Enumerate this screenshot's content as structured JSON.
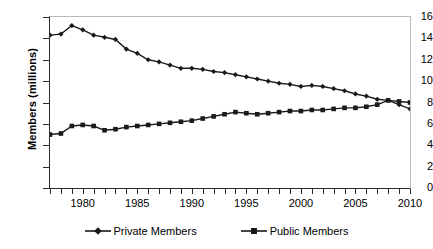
{
  "chart_data": {
    "type": "line",
    "title": "",
    "xlabel": "",
    "ylabel": "Members (millions)",
    "xlim": [
      1977,
      2010
    ],
    "ylim": [
      0,
      16
    ],
    "ytick_step": 2,
    "yticks": [
      "0",
      "2",
      "4",
      "6",
      "8",
      "10",
      "12",
      "14",
      "16"
    ],
    "xticks_labeled": [
      "1980",
      "1985",
      "1990",
      "1995",
      "2000",
      "2005",
      "2010"
    ],
    "xtick_minor_step": 1,
    "grid": false,
    "legend_position": "bottom-center",
    "x": [
      1977,
      1978,
      1979,
      1980,
      1981,
      1982,
      1983,
      1984,
      1985,
      1986,
      1987,
      1988,
      1989,
      1990,
      1991,
      1992,
      1993,
      1994,
      1995,
      1996,
      1997,
      1998,
      1999,
      2000,
      2001,
      2002,
      2003,
      2004,
      2005,
      2006,
      2007,
      2008,
      2009,
      2010
    ],
    "series": [
      {
        "name": "Private Members",
        "marker": "diamond",
        "color": "#1a1a1a",
        "values": [
          14.3,
          14.4,
          15.2,
          14.8,
          14.3,
          14.1,
          13.9,
          13.0,
          12.6,
          12.0,
          11.8,
          11.5,
          11.2,
          11.2,
          11.1,
          10.9,
          10.8,
          10.6,
          10.4,
          10.2,
          10.0,
          9.8,
          9.7,
          9.5,
          9.6,
          9.5,
          9.3,
          9.1,
          8.8,
          8.6,
          8.3,
          8.2,
          7.8,
          7.4
        ]
      },
      {
        "name": "Public Members",
        "marker": "square",
        "color": "#1a1a1a",
        "values": [
          5.0,
          5.1,
          5.8,
          5.9,
          5.8,
          5.4,
          5.5,
          5.7,
          5.8,
          5.9,
          6.0,
          6.1,
          6.2,
          6.3,
          6.5,
          6.7,
          6.9,
          7.1,
          7.0,
          6.9,
          7.0,
          7.1,
          7.2,
          7.2,
          7.3,
          7.3,
          7.4,
          7.5,
          7.5,
          7.6,
          7.8,
          8.2,
          8.1,
          8.0
        ]
      }
    ]
  },
  "legend": {
    "items": [
      {
        "label": "Private Members"
      },
      {
        "label": "Public Members"
      }
    ]
  }
}
